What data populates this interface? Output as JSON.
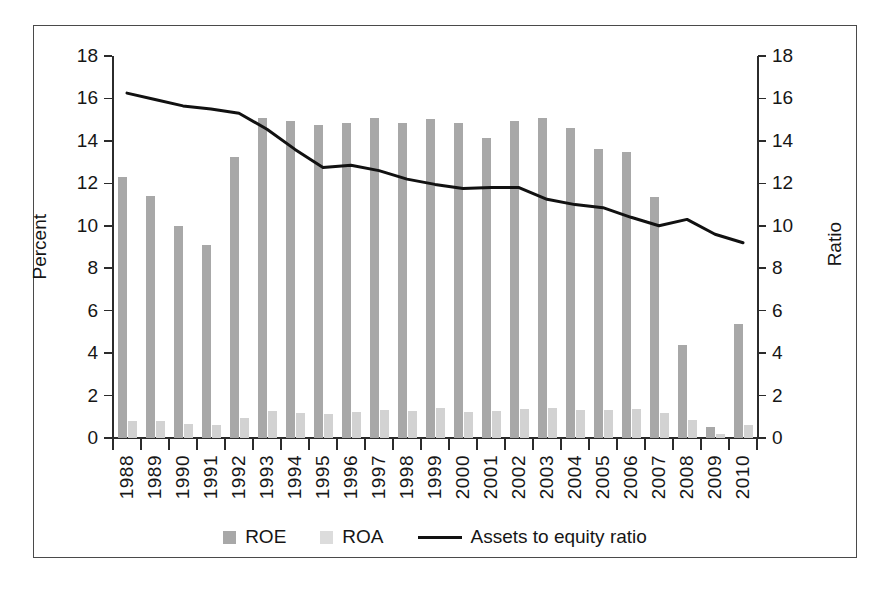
{
  "chart_data": {
    "type": "bar",
    "title": "",
    "xlabel": "",
    "ylabel": "Percent",
    "y2label": "Ratio",
    "ylim": [
      0,
      18
    ],
    "y2lim": [
      0,
      18
    ],
    "ytick_values": [
      0,
      2,
      4,
      6,
      8,
      10,
      12,
      14,
      16,
      18
    ],
    "ytick_labels": [
      "0",
      "2",
      "4",
      "6",
      "8",
      "10",
      "12",
      "14",
      "16",
      "18"
    ],
    "y2tick_labels": [
      "0",
      "2",
      "4",
      "6",
      "8",
      "10",
      "12",
      "14",
      "16",
      "18"
    ],
    "grid": false,
    "legend_position": "bottom-center",
    "categories": [
      "1988",
      "1989",
      "1990",
      "1991",
      "1992",
      "1993",
      "1994",
      "1995",
      "1996",
      "1997",
      "1998",
      "1999",
      "2000",
      "2001",
      "2002",
      "2003",
      "2004",
      "2005",
      "2006",
      "2007",
      "2008",
      "2009",
      "2010"
    ],
    "series": [
      {
        "name": "ROE",
        "type": "bar",
        "color": "#a8a8a8",
        "axis": "left",
        "values": [
          12.3,
          11.4,
          10.0,
          9.1,
          13.25,
          15.1,
          14.95,
          14.75,
          14.85,
          15.1,
          14.85,
          15.05,
          14.85,
          14.15,
          14.95,
          15.1,
          14.6,
          13.6,
          13.5,
          11.35,
          4.4,
          0.5,
          5.35
        ]
      },
      {
        "name": "ROA",
        "type": "bar",
        "color": "#d2d2d2",
        "axis": "left",
        "values": [
          0.78,
          0.8,
          0.65,
          0.6,
          0.92,
          1.25,
          1.18,
          1.15,
          1.22,
          1.32,
          1.25,
          1.4,
          1.23,
          1.25,
          1.35,
          1.42,
          1.32,
          1.32,
          1.35,
          1.16,
          0.85,
          0.2,
          0.6
        ]
      },
      {
        "name": "Assets to equity ratio",
        "type": "line",
        "color": "#111111",
        "axis": "right",
        "values": [
          16.25,
          15.95,
          15.65,
          15.5,
          15.3,
          14.55,
          13.6,
          12.75,
          12.85,
          12.6,
          12.2,
          11.95,
          11.75,
          11.8,
          11.8,
          11.25,
          11.0,
          10.85,
          10.4,
          10.0,
          9.95,
          9.95,
          10.3
        ]
      }
    ],
    "line_series_extra_points": [
      10.3,
      9.6,
      9.2
    ],
    "legend_entries": [
      {
        "label": "ROE",
        "marker": "square",
        "color": "#a8a8a8"
      },
      {
        "label": "ROA",
        "marker": "square",
        "color": "#dcdcdc"
      },
      {
        "label": "Assets to equity ratio",
        "marker": "line",
        "color": "#111111"
      }
    ]
  }
}
